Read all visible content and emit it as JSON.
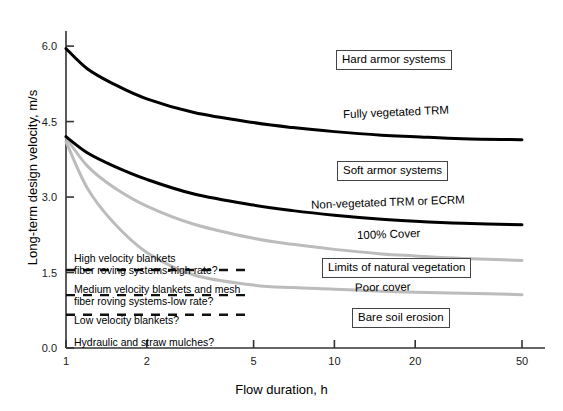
{
  "chart_data": {
    "type": "line",
    "title": "",
    "xlabel": "Flow duration, h",
    "ylabel": "Long-term design velocity, m/s",
    "xscale": "log",
    "xlim": [
      1,
      50
    ],
    "ylim": [
      0.0,
      6.3
    ],
    "xticks": [
      "1",
      "2",
      "5",
      "10",
      "20",
      "50"
    ],
    "xtick_values": [
      1,
      2,
      5,
      10,
      20,
      50
    ],
    "yticks": [
      "0.0",
      "1.5",
      "3.0",
      "4.5",
      "6.0"
    ],
    "ytick_values": [
      0.0,
      1.5,
      3.0,
      4.5,
      6.0
    ],
    "grid": false,
    "legend": "inline-annotations",
    "series": [
      {
        "name": "Fully vegetated TRM",
        "color": "#000000",
        "width": 3,
        "x": [
          1,
          1.2,
          1.5,
          2,
          3,
          5,
          7,
          10,
          15,
          20,
          30,
          50
        ],
        "y": [
          5.95,
          5.55,
          5.25,
          4.95,
          4.68,
          4.48,
          4.38,
          4.3,
          4.23,
          4.2,
          4.16,
          4.14
        ]
      },
      {
        "name": "Non-vegetated TRM or ECRM",
        "color": "#000000",
        "width": 3,
        "x": [
          1,
          1.2,
          1.5,
          2,
          3,
          5,
          7,
          10,
          15,
          20,
          30,
          50
        ],
        "y": [
          4.2,
          3.88,
          3.62,
          3.35,
          3.06,
          2.84,
          2.73,
          2.64,
          2.56,
          2.52,
          2.48,
          2.45
        ]
      },
      {
        "name": "100% Cover",
        "color": "#bcbcbc",
        "width": 3,
        "x": [
          1,
          1.2,
          1.5,
          2,
          3,
          5,
          7,
          10,
          15,
          20,
          30,
          50
        ],
        "y": [
          4.18,
          3.62,
          3.2,
          2.82,
          2.46,
          2.18,
          2.06,
          1.96,
          1.87,
          1.83,
          1.78,
          1.74
        ]
      },
      {
        "name": "Poor cover",
        "color": "#bcbcbc",
        "width": 3,
        "x": [
          1,
          1.2,
          1.5,
          2,
          3,
          5,
          7,
          10,
          15,
          20,
          30,
          50
        ],
        "y": [
          4.1,
          3.18,
          2.5,
          1.9,
          1.45,
          1.25,
          1.2,
          1.17,
          1.13,
          1.11,
          1.09,
          1.06
        ]
      }
    ],
    "dashed_thresholds": [
      {
        "label_lines": [
          "High velocity blankets",
          "fiber roving systems-high rate?"
        ],
        "y": 1.55
      },
      {
        "label_lines": [
          "Medium velocity blankets and mesh",
          "fiber roving systems-low rate?"
        ],
        "y": 1.05
      },
      {
        "label_lines": [
          "Low velocity blankets?"
        ],
        "y": 0.66
      },
      {
        "label_lines": [
          "Hydraulic and straw mulches?"
        ],
        "y": 0.0
      }
    ],
    "annotations": [
      {
        "text": "Hard armor systems",
        "boxed": true
      },
      {
        "text": "Fully vegetated TRM",
        "boxed": false
      },
      {
        "text": "Soft armor systems",
        "boxed": true
      },
      {
        "text": "Non-vegetated TRM or ECRM",
        "boxed": false
      },
      {
        "text": "100% Cover",
        "boxed": false
      },
      {
        "text": "Limits of natural vegetation",
        "boxed": true
      },
      {
        "text": "Poor cover",
        "boxed": false
      },
      {
        "text": "Bare soil erosion",
        "boxed": true
      }
    ],
    "colors": {
      "axis": "#333333",
      "dark_curve": "#000000",
      "light_curve": "#bcbcbc",
      "background": "#ffffff"
    }
  },
  "axes": {
    "x_title": "Flow duration, h",
    "y_title": "Long-term design velocity, m/s",
    "x_ticks": [
      "1",
      "2",
      "5",
      "10",
      "20",
      "50"
    ],
    "y_ticks": [
      "0.0",
      "1.5",
      "3.0",
      "4.5",
      "6.0"
    ]
  },
  "labels": {
    "hard_armor": "Hard armor systems",
    "fully_vegetated_trm": "Fully vegetated TRM",
    "soft_armor": "Soft armor systems",
    "non_vegetated": "Non-vegetated TRM or ECRM",
    "cover_100": "100% Cover",
    "limits_natural_vegetation": "Limits of natural vegetation",
    "poor_cover": "Poor cover",
    "bare_soil_erosion": "Bare soil erosion",
    "high_velocity_l1": "High velocity blankets",
    "high_velocity_l2": "fiber roving systems-high rate?",
    "medium_velocity_l1": "Medium velocity blankets and mesh",
    "medium_velocity_l2": "fiber roving systems-low rate?",
    "low_velocity": "Low velocity blankets?",
    "hydraulic_mulches": "Hydraulic and straw mulches?"
  }
}
